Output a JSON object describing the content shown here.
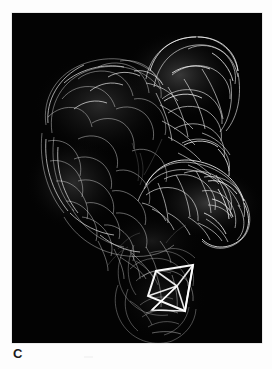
{
  "figure": {
    "panel_label": "C",
    "modality": "3d-surface-rendering",
    "background_color": "#ffffff",
    "panel_background_color": "#030303",
    "panel": {
      "x": 12,
      "y": 13,
      "width": 250,
      "height": 330
    },
    "render_stroke_color": "#d9d9d9",
    "annotation": {
      "name": "roi-wireframe-box",
      "color": "#ffffff",
      "line_width_px": 2,
      "shape": "3d-box-outline",
      "location_description": "sigmoid-rectum region, lower middle of panel",
      "outer_points": "148,296 156,271 193,265 185,311",
      "inner_points": "177,286 193,265 185,311 152,310",
      "diagonals": [
        "156,271 177,286",
        "148,296 177,286",
        "177,286 185,311",
        "177,286 152,310"
      ]
    },
    "segments": [
      {
        "name": "transverse-colon-upper-left",
        "brightness": "medium"
      },
      {
        "name": "hepatic-flexure-upper-right",
        "brightness": "high"
      },
      {
        "name": "descending-colon-left",
        "brightness": "medium"
      },
      {
        "name": "transverse-colon-right-loop",
        "brightness": "high"
      },
      {
        "name": "sigmoid-colon-lower",
        "brightness": "low"
      },
      {
        "name": "rectum-lower",
        "brightness": "low"
      }
    ]
  }
}
